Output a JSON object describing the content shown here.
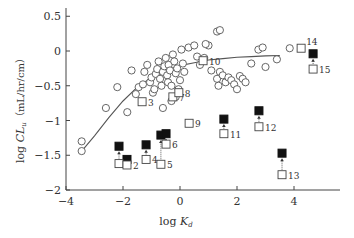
{
  "chart_data": {
    "type": "scatter",
    "title": "",
    "xlabel": "log K_d",
    "xlabel_main": "log ",
    "xlabel_var": "K",
    "xlabel_sub": "d",
    "ylabel": "log CL_u (mL/hr/cm)",
    "ylabel_main": "log ",
    "ylabel_var": "CL",
    "ylabel_sub": "u",
    "ylabel_units": "（mL/hr/cm）",
    "xlim": [
      -4,
      5.4
    ],
    "ylim": [
      -2,
      0.6
    ],
    "xticks": [
      -4,
      -2,
      0,
      2,
      4
    ],
    "xtick_labels": [
      "−4",
      "−2",
      "0",
      "2",
      "4"
    ],
    "yticks": [
      0.5,
      0,
      -0.5,
      -1,
      -1.5,
      -2
    ],
    "ytick_labels": [
      "0.5",
      "0",
      "−0.5",
      "−1",
      "−1.5",
      "−2"
    ],
    "grid": false,
    "legend": null,
    "series": [
      {
        "name": "reference compounds",
        "marker": "open-circle",
        "points": [
          [
            -3.45,
            -1.3
          ],
          [
            -3.45,
            -1.44
          ],
          [
            -2.6,
            -0.82
          ],
          [
            -2.2,
            -0.52
          ],
          [
            -1.85,
            -0.88
          ],
          [
            -1.7,
            -0.28
          ],
          [
            -1.55,
            -0.62
          ],
          [
            -1.45,
            -0.52
          ],
          [
            -1.3,
            -0.48
          ],
          [
            -1.25,
            -0.3
          ],
          [
            -1.15,
            -0.2
          ],
          [
            -1.05,
            -0.45
          ],
          [
            -1.0,
            -0.38
          ],
          [
            -0.95,
            -0.6
          ],
          [
            -0.9,
            -0.55
          ],
          [
            -0.85,
            -0.33
          ],
          [
            -0.8,
            -0.26
          ],
          [
            -0.75,
            -0.15
          ],
          [
            -0.7,
            -0.4
          ],
          [
            -0.65,
            -0.5
          ],
          [
            -0.6,
            -0.3
          ],
          [
            -0.55,
            -0.22
          ],
          [
            -0.5,
            -0.1
          ],
          [
            -0.45,
            -0.35
          ],
          [
            -0.42,
            -0.45
          ],
          [
            -0.4,
            -0.2
          ],
          [
            -0.35,
            -0.28
          ],
          [
            -0.3,
            -0.5
          ],
          [
            -0.25,
            -0.05
          ],
          [
            -0.2,
            -0.15
          ],
          [
            -0.15,
            -0.32
          ],
          [
            -0.1,
            -0.25
          ],
          [
            -0.05,
            -0.55
          ],
          [
            0.0,
            -0.42
          ],
          [
            0.05,
            0.02
          ],
          [
            0.1,
            -0.18
          ],
          [
            -0.3,
            -0.72
          ],
          [
            -0.6,
            -0.82
          ],
          [
            -0.15,
            -0.66
          ],
          [
            0.15,
            -0.3
          ],
          [
            0.3,
            0.05
          ],
          [
            0.5,
            0.08
          ],
          [
            0.6,
            -0.08
          ],
          [
            0.85,
            -0.1
          ],
          [
            1.0,
            0.08
          ],
          [
            1.3,
            0.28
          ],
          [
            1.4,
            0.3
          ],
          [
            1.3,
            -0.4
          ],
          [
            1.35,
            -0.5
          ],
          [
            1.4,
            -0.3
          ],
          [
            1.5,
            -0.35
          ],
          [
            1.6,
            -0.45
          ],
          [
            1.7,
            -0.38
          ],
          [
            1.8,
            -0.42
          ],
          [
            1.9,
            -0.48
          ],
          [
            2.0,
            -0.55
          ],
          [
            2.1,
            -0.36
          ],
          [
            2.2,
            -0.4
          ],
          [
            2.3,
            -0.45
          ],
          [
            2.5,
            -0.18
          ],
          [
            2.75,
            0.02
          ],
          [
            2.9,
            0.05
          ],
          [
            3.0,
            -0.23
          ],
          [
            3.4,
            -0.12
          ],
          [
            3.85,
            0.04
          ],
          [
            0.9,
            0.1
          ],
          [
            0.7,
            -0.2
          ],
          [
            1.1,
            -0.28
          ]
        ]
      },
      {
        "name": "test compounds (open, measured)",
        "marker": "open-square",
        "points": [
          {
            "id": "1",
            "x": -2.14,
            "y": -1.62
          },
          {
            "id": "2",
            "x": -1.86,
            "y": -1.64
          },
          {
            "id": "3",
            "x": -1.33,
            "y": -0.73
          },
          {
            "id": "4",
            "x": -1.19,
            "y": -1.56
          },
          {
            "id": "5",
            "x": -0.67,
            "y": -1.63
          },
          {
            "id": "6",
            "x": -0.49,
            "y": -1.34
          },
          {
            "id": "7",
            "x": -0.25,
            "y": -0.66
          },
          {
            "id": "8",
            "x": -0.04,
            "y": -0.6
          },
          {
            "id": "9",
            "x": 0.32,
            "y": -1.04
          },
          {
            "id": "10",
            "x": 0.81,
            "y": -0.14
          },
          {
            "id": "11",
            "x": 1.54,
            "y": -1.19
          },
          {
            "id": "12",
            "x": 2.77,
            "y": -1.09
          },
          {
            "id": "13",
            "x": 3.58,
            "y": -1.78
          },
          {
            "id": "14",
            "x": 4.25,
            "y": 0.04
          },
          {
            "id": "15",
            "x": 4.67,
            "y": -0.26
          }
        ]
      },
      {
        "name": "test compounds (filled, corrected)",
        "marker": "filled-square",
        "points": [
          {
            "id": "1",
            "x": -2.14,
            "y": -1.37
          },
          {
            "id": "2",
            "x": -1.86,
            "y": -1.56
          },
          {
            "id": "4",
            "x": -1.19,
            "y": -1.35
          },
          {
            "id": "5",
            "x": -0.67,
            "y": -1.21
          },
          {
            "id": "6",
            "x": -0.49,
            "y": -1.19
          },
          {
            "id": "11",
            "x": 1.54,
            "y": -0.98
          },
          {
            "id": "12",
            "x": 2.77,
            "y": -0.86
          },
          {
            "id": "13",
            "x": 3.58,
            "y": -1.47
          },
          {
            "id": "15",
            "x": 4.67,
            "y": -0.04
          }
        ]
      }
    ],
    "arrows_from_open_to_filled": [
      "1",
      "2",
      "4",
      "5",
      "6",
      "11",
      "12",
      "13",
      "15"
    ],
    "fit_curve": {
      "name": "sigmoidal fit",
      "points": [
        [
          -3.45,
          -1.44
        ],
        [
          -3.0,
          -1.22
        ],
        [
          -2.5,
          -0.96
        ],
        [
          -2.0,
          -0.72
        ],
        [
          -1.5,
          -0.52
        ],
        [
          -1.0,
          -0.38
        ],
        [
          -0.5,
          -0.28
        ],
        [
          0.0,
          -0.21
        ],
        [
          0.5,
          -0.17
        ],
        [
          1.0,
          -0.13
        ],
        [
          1.5,
          -0.11
        ],
        [
          2.0,
          -0.09
        ],
        [
          2.5,
          -0.08
        ],
        [
          3.0,
          -0.07
        ],
        [
          3.5,
          -0.065
        ]
      ]
    }
  }
}
